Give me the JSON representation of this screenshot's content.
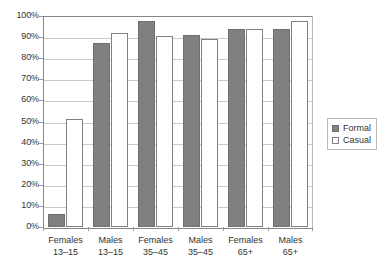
{
  "chart_data": {
    "type": "bar",
    "title": "",
    "subtitle": "",
    "xlabel": "",
    "ylabel": "",
    "ylim": [
      0,
      100
    ],
    "y_tick_labels": [
      "0%",
      "10%",
      "20%",
      "30%",
      "40%",
      "50%",
      "60%",
      "70%",
      "80%",
      "90%",
      "100%"
    ],
    "y_tick_values": [
      0,
      10,
      20,
      30,
      40,
      50,
      60,
      70,
      80,
      90,
      100
    ],
    "grid": true,
    "legend_position": "right",
    "categories": [
      "Females 13–15",
      "Males 13–15",
      "Females 35–45",
      "Males 35–45",
      "Females 65+",
      "Males 65+"
    ],
    "category_lines": [
      [
        "Females",
        "13–15"
      ],
      [
        "Males",
        "13–15"
      ],
      [
        "Females",
        "35–45"
      ],
      [
        "Males",
        "35–45"
      ],
      [
        "Females",
        "65+"
      ],
      [
        "Males",
        "65+"
      ]
    ],
    "series": [
      {
        "name": "Formal",
        "color": "#808080",
        "values": [
          6,
          87,
          97.5,
          91,
          94,
          94
        ]
      },
      {
        "name": "Casual",
        "color": "#ffffff",
        "values": [
          51,
          92,
          90.5,
          89,
          94,
          97.5
        ]
      }
    ]
  },
  "legend": {
    "items": [
      {
        "label": "Formal",
        "swatch": "filled-gray-square"
      },
      {
        "label": "Casual",
        "swatch": "outlined-white-square"
      }
    ]
  }
}
